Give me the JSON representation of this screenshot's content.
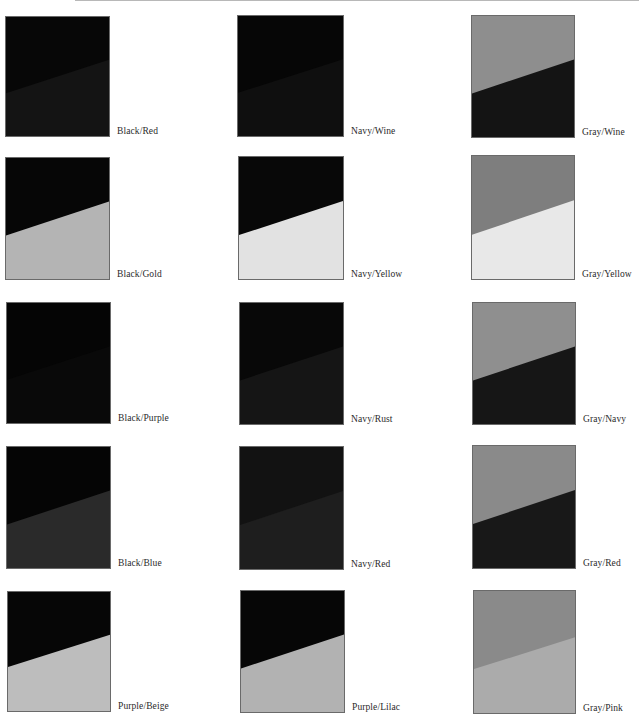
{
  "page": {
    "background": "#ffffff"
  },
  "swatches": [
    {
      "label": "Black/Red",
      "top": "#070707",
      "bottom": "#141414",
      "left_y": 64,
      "right_y": 36,
      "x": 5,
      "y": 16,
      "w": 105,
      "h": 121
    },
    {
      "label": "Navy/Wine",
      "top": "#060606",
      "bottom": "#0f0f0f",
      "left_y": 64,
      "right_y": 36,
      "x": 237,
      "y": 15,
      "w": 107,
      "h": 122
    },
    {
      "label": "Gray/Wine",
      "top": "#8e8e8e",
      "bottom": "#141414",
      "left_y": 64,
      "right_y": 36,
      "x": 471,
      "y": 15,
      "w": 104,
      "h": 123
    },
    {
      "label": "Black/Gold",
      "top": "#060606",
      "bottom": "#b4b4b4",
      "left_y": 64,
      "right_y": 36,
      "x": 5,
      "y": 157,
      "w": 105,
      "h": 123
    },
    {
      "label": "Navy/Yellow",
      "top": "#080808",
      "bottom": "#e2e2e2",
      "left_y": 64,
      "right_y": 36,
      "x": 238,
      "y": 156,
      "w": 106,
      "h": 124
    },
    {
      "label": "Gray/Yellow",
      "top": "#7e7e7e",
      "bottom": "#e8e8e8",
      "left_y": 64,
      "right_y": 36,
      "x": 471,
      "y": 155,
      "w": 104,
      "h": 125
    },
    {
      "label": "Black/Purple",
      "top": "#050505",
      "bottom": "#090909",
      "left_y": 64,
      "right_y": 36,
      "x": 6,
      "y": 302,
      "w": 105,
      "h": 122
    },
    {
      "label": "Navy/Rust",
      "top": "#080808",
      "bottom": "#151515",
      "left_y": 64,
      "right_y": 36,
      "x": 239,
      "y": 302,
      "w": 105,
      "h": 123
    },
    {
      "label": "Gray/Navy",
      "top": "#8f8f8f",
      "bottom": "#161616",
      "left_y": 64,
      "right_y": 36,
      "x": 472,
      "y": 302,
      "w": 104,
      "h": 123
    },
    {
      "label": "Black/Blue",
      "top": "#050505",
      "bottom": "#2a2a2a",
      "left_y": 64,
      "right_y": 36,
      "x": 6,
      "y": 446,
      "w": 105,
      "h": 123
    },
    {
      "label": "Navy/Red",
      "top": "#121212",
      "bottom": "#1e1e1e",
      "left_y": 64,
      "right_y": 36,
      "x": 239,
      "y": 446,
      "w": 105,
      "h": 124
    },
    {
      "label": "Gray/Red",
      "top": "#8a8a8a",
      "bottom": "#181818",
      "left_y": 64,
      "right_y": 36,
      "x": 472,
      "y": 445,
      "w": 104,
      "h": 124
    },
    {
      "label": "Purple/Beige",
      "top": "#060606",
      "bottom": "#bdbdbd",
      "left_y": 63,
      "right_y": 36,
      "x": 7,
      "y": 591,
      "w": 104,
      "h": 121
    },
    {
      "label": "Purple/Lilac",
      "top": "#060606",
      "bottom": "#b2b2b2",
      "left_y": 64,
      "right_y": 36,
      "x": 240,
      "y": 590,
      "w": 105,
      "h": 123
    },
    {
      "label": "Gray/Pink",
      "top": "#8a8a8a",
      "bottom": "#ababab",
      "left_y": 64,
      "right_y": 38,
      "x": 473,
      "y": 590,
      "w": 103,
      "h": 124
    }
  ]
}
